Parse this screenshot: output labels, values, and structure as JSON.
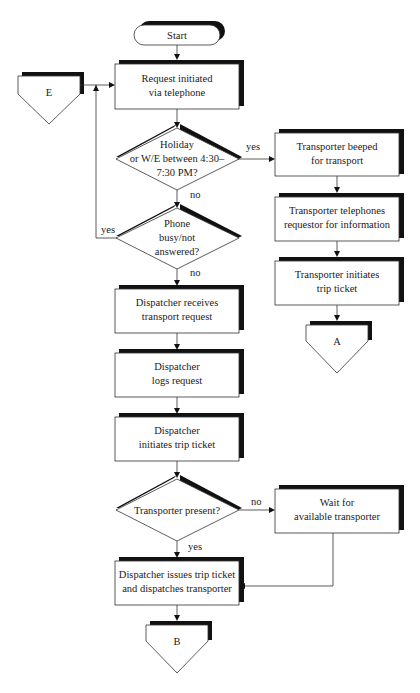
{
  "diagram": {
    "type": "flowchart",
    "nodes": {
      "start": {
        "shape": "terminator",
        "label": "Start"
      },
      "request": {
        "shape": "process",
        "line1": "Request initiated",
        "line2": "via telephone"
      },
      "connector_e": {
        "shape": "off-page-connector",
        "label": "E"
      },
      "holiday": {
        "shape": "decision",
        "line1": "Holiday",
        "line2": "or W/E between 4:30–",
        "line3": "7:30 PM?"
      },
      "phone_busy": {
        "shape": "decision",
        "line1": "Phone",
        "line2": "busy/not",
        "line3": "answered?"
      },
      "beeped": {
        "shape": "process",
        "line1": "Transporter beeped",
        "line2": "for transport"
      },
      "telephones": {
        "shape": "process",
        "line1": "Transporter telephones",
        "line2": "requestor for information"
      },
      "trans_initiates": {
        "shape": "process",
        "line1": "Transporter initiates",
        "line2": "trip ticket"
      },
      "connector_a": {
        "shape": "off-page-connector",
        "label": "A"
      },
      "receives": {
        "shape": "process",
        "line1": "Dispatcher receives",
        "line2": "transport request"
      },
      "logs": {
        "shape": "process",
        "line1": "Dispatcher",
        "line2": "logs request"
      },
      "disp_initiates": {
        "shape": "process",
        "line1": "Dispatcher",
        "line2": "initiates trip ticket"
      },
      "present": {
        "shape": "decision",
        "line1": "Transporter present?"
      },
      "wait": {
        "shape": "process",
        "line1": "Wait for",
        "line2": "available transporter"
      },
      "issues": {
        "shape": "process",
        "line1": "Dispatcher issues trip ticket",
        "line2": "and dispatches transporter"
      },
      "connector_b": {
        "shape": "off-page-connector",
        "label": "B"
      }
    },
    "edge_labels": {
      "holiday_yes": "yes",
      "holiday_no": "no",
      "phone_yes": "yes",
      "phone_no": "no",
      "present_no": "no",
      "present_yes": "yes"
    }
  }
}
